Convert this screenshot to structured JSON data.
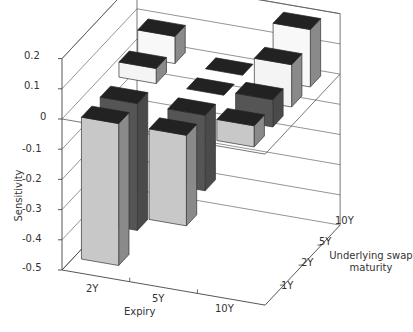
{
  "chart_data": {
    "type": "bar3d",
    "title": "",
    "xlabel": "Expiry",
    "ylabel": "Sensitivity",
    "zlabel": "Underlying swap maturity",
    "zlabel_lines": [
      "Underlying swap",
      "maturity"
    ],
    "x_categories": [
      "2Y",
      "5Y",
      "10Y"
    ],
    "depth_categories": [
      "1Y",
      "2Y",
      "5Y",
      "10Y"
    ],
    "yticks": [
      "0.2",
      "0.1",
      "0",
      "-0.1",
      "-0.2",
      "-0.3",
      "-0.4",
      "-0.5"
    ],
    "ylim": [
      -0.5,
      0.2
    ],
    "grid": true,
    "series": [
      {
        "name": "1Y",
        "color": "#c8c8c8",
        "values": [
          -0.47,
          -0.3,
          0.07
        ]
      },
      {
        "name": "2Y",
        "color": "#555555",
        "values": [
          -0.42,
          -0.25,
          0.09
        ]
      },
      {
        "name": "5Y",
        "color": "#f4f4f4",
        "values": [
          0.05,
          0.0,
          0.14
        ]
      },
      {
        "name": "10Y",
        "color": "#f8f8f8",
        "values": [
          0.09,
          0.0,
          0.19
        ]
      }
    ]
  }
}
